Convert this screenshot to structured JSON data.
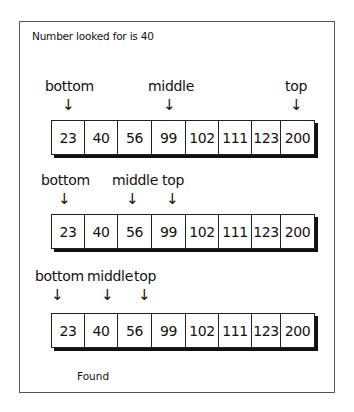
{
  "title": "Number looked for is 40",
  "array_values": [
    "23",
    "40",
    "56",
    "99",
    "102",
    "111",
    "123",
    "200"
  ],
  "cell_widths": [
    33,
    33,
    34,
    34,
    33,
    33,
    29,
    33
  ],
  "steps": [
    {
      "labels": {
        "bottom": "bottom",
        "middle": "middle",
        "top": "top"
      },
      "pointers": {
        "bottom": 0,
        "middle": 3,
        "top": 7
      }
    },
    {
      "labels": {
        "bottom": "bottom",
        "middle": "middle",
        "top": "top"
      },
      "pointers": {
        "bottom": 0,
        "middle": 2,
        "top": 3
      }
    },
    {
      "labels": {
        "bottom": "bottom",
        "middle": "middle",
        "top": "top"
      },
      "pointers": {
        "bottom": 0,
        "middle": 1,
        "top": 2
      }
    }
  ],
  "arrow_glyph": "↓",
  "result": "Found"
}
